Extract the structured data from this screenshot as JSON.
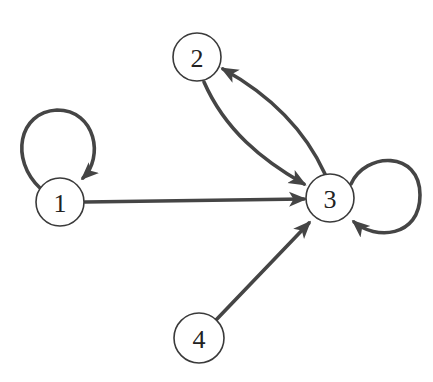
{
  "diagram": {
    "type": "directed-graph",
    "colors": {
      "edge": "#454545",
      "node_stroke": "#3a3a3a",
      "node_fill": "#ffffff",
      "label": "#222222",
      "background": "#ffffff"
    },
    "nodes": [
      {
        "id": "1",
        "label": "1",
        "cx": 60,
        "cy": 202,
        "r": 24
      },
      {
        "id": "2",
        "label": "2",
        "cx": 197,
        "cy": 57,
        "r": 24
      },
      {
        "id": "3",
        "label": "3",
        "cx": 330,
        "cy": 198,
        "r": 24
      },
      {
        "id": "4",
        "label": "4",
        "cx": 199,
        "cy": 338,
        "r": 25
      }
    ],
    "edges": [
      {
        "from": "1",
        "to": "1",
        "kind": "self-loop"
      },
      {
        "from": "1",
        "to": "3",
        "kind": "straight"
      },
      {
        "from": "2",
        "to": "3",
        "kind": "curved"
      },
      {
        "from": "3",
        "to": "2",
        "kind": "curved"
      },
      {
        "from": "3",
        "to": "3",
        "kind": "self-loop"
      },
      {
        "from": "4",
        "to": "3",
        "kind": "straight"
      }
    ]
  }
}
